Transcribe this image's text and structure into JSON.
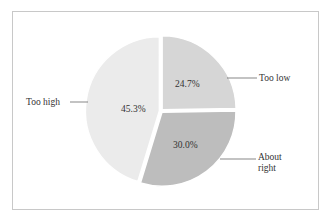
{
  "chart_data": {
    "type": "pie",
    "title": "",
    "categories": [
      "Too low",
      "About right",
      "Too high"
    ],
    "values": [
      24.7,
      30.0,
      45.3
    ],
    "value_labels": [
      "24.7%",
      "30.0%",
      "45.3%"
    ],
    "colors": [
      "#d6d6d6",
      "#bdbdbd",
      "#ebebeb"
    ],
    "start_angle": "12 o'clock, clockwise",
    "legend": "none (callout labels)",
    "label_lines": true
  },
  "labels": {
    "too_low": "Too low",
    "about_right_1": "About",
    "about_right_2": "right",
    "too_high": "Too high"
  },
  "percent_labels": {
    "too_low": "24.7%",
    "about_right": "30.0%",
    "too_high": "45.3%"
  }
}
